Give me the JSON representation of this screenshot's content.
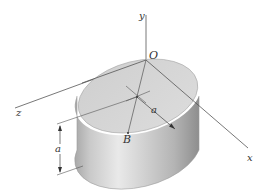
{
  "figure": {
    "labels": {
      "y_axis": "y",
      "x_axis": "x",
      "z_axis": "z",
      "origin": "O",
      "point_b": "B",
      "radius": "a",
      "height": "a"
    },
    "colors": {
      "axis": "#4a4a4a",
      "top_face": "#d4d4d4",
      "side_light": "#e6e6e6",
      "side_dark": "#9a9a9a",
      "edge": "#8c8c8c"
    }
  }
}
